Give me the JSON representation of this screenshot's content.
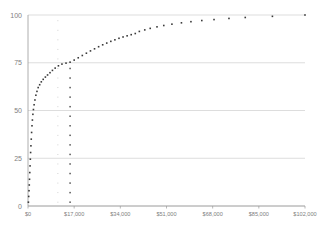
{
  "chart_data": {
    "type": "scatter",
    "title": "",
    "subtitle": "",
    "xlabel": "",
    "ylabel": "",
    "xlim": [
      0,
      102000
    ],
    "ylim": [
      0,
      100
    ],
    "grid": true,
    "grid_axis": "y",
    "legend": null,
    "legend_position": "none",
    "marker": {
      "shape": "square",
      "size_px": 1.6,
      "color": "#3a3a3a"
    },
    "colors": {
      "marker": "#3a3a3a",
      "gridline": "#cfcfcf",
      "axis": "#9a9a9a",
      "tick_label": "#808080",
      "background": "#ffffff",
      "reference_line_light": "#c8c8c8",
      "reference_line_dark": "#555555"
    },
    "y_ticks": [
      0,
      25,
      50,
      75,
      100
    ],
    "y_tick_labels": [
      "0",
      "25",
      "50",
      "75",
      "100"
    ],
    "x_ticks": [
      0,
      17000,
      34000,
      51000,
      68000,
      85000,
      102000
    ],
    "x_tick_labels": [
      "$0",
      "$17,000",
      "$34,000",
      "$51,000",
      "$68,000",
      "$85,000",
      "$102,000"
    ],
    "annotations": [
      {
        "name": "reference-line-1",
        "type": "vertical-dotted-line",
        "x": 11000,
        "y_from": 0,
        "y_to": 100,
        "style": "dotted",
        "color": "#c8c8c8"
      },
      {
        "name": "reference-line-2",
        "type": "vertical-dotted-line",
        "x": 15500,
        "y_from": 0,
        "y_to": 75,
        "style": "dotted",
        "color": "#555555"
      }
    ],
    "series": [
      {
        "name": "cumulative-distribution",
        "points": [
          [
            150,
            2.0
          ],
          [
            260,
            5.0
          ],
          [
            370,
            8.0
          ],
          [
            470,
            11.0
          ],
          [
            560,
            14.0
          ],
          [
            660,
            17.5
          ],
          [
            760,
            21.0
          ],
          [
            860,
            24.5
          ],
          [
            960,
            28.0
          ],
          [
            1080,
            31.5
          ],
          [
            1200,
            35.0
          ],
          [
            1330,
            38.5
          ],
          [
            1470,
            42.0
          ],
          [
            1620,
            45.0
          ],
          [
            1800,
            48.0
          ],
          [
            2000,
            50.5
          ],
          [
            2250,
            53.0
          ],
          [
            2550,
            55.5
          ],
          [
            2900,
            58.0
          ],
          [
            3300,
            60.0
          ],
          [
            3750,
            62.0
          ],
          [
            4300,
            63.5
          ],
          [
            4900,
            65.0
          ],
          [
            5600,
            66.3
          ],
          [
            6400,
            67.5
          ],
          [
            7200,
            68.6
          ],
          [
            8100,
            69.8
          ],
          [
            9000,
            71.0
          ],
          [
            10000,
            72.2
          ],
          [
            11200,
            73.4
          ],
          [
            12500,
            74.3
          ],
          [
            14000,
            74.8
          ],
          [
            15500,
            75.3
          ],
          [
            17000,
            76.4
          ],
          [
            18500,
            77.6
          ],
          [
            20000,
            78.8
          ],
          [
            21500,
            80.0
          ],
          [
            23000,
            81.2
          ],
          [
            24500,
            82.3
          ],
          [
            26000,
            83.4
          ],
          [
            27500,
            84.4
          ],
          [
            29000,
            85.3
          ],
          [
            30500,
            86.2
          ],
          [
            32000,
            87.0
          ],
          [
            33500,
            87.8
          ],
          [
            35000,
            88.5
          ],
          [
            36500,
            89.1
          ],
          [
            38000,
            89.7
          ],
          [
            39500,
            90.3
          ],
          [
            41000,
            91.4
          ],
          [
            43000,
            92.2
          ],
          [
            45000,
            93.0
          ],
          [
            47500,
            93.8
          ],
          [
            50000,
            94.5
          ],
          [
            53000,
            95.2
          ],
          [
            56500,
            95.9
          ],
          [
            60000,
            96.5
          ],
          [
            64000,
            97.1
          ],
          [
            68500,
            97.6
          ],
          [
            74000,
            98.2
          ],
          [
            80000,
            98.7
          ],
          [
            90000,
            99.3
          ],
          [
            102000,
            100.0
          ]
        ]
      }
    ],
    "dotted_column_1_points": [
      2,
      7,
      12,
      17,
      22,
      27,
      32,
      37,
      42,
      47,
      52,
      57,
      62,
      67,
      72,
      77,
      82,
      87,
      92,
      97
    ],
    "dotted_column_2_points": [
      2,
      7,
      12,
      17,
      22,
      27,
      32,
      37,
      42,
      47,
      52,
      57,
      62,
      67,
      72
    ]
  },
  "plot_geometry": {
    "left": 28,
    "right": 305,
    "top": 15,
    "bottom": 206
  }
}
